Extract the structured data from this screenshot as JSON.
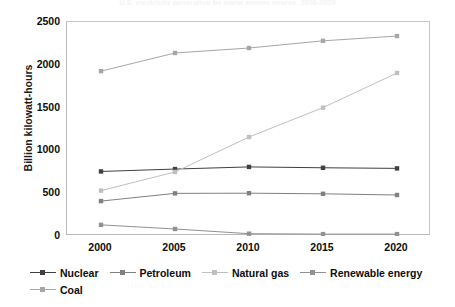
{
  "chart_data": {
    "type": "line",
    "title": "U.S. electricity generation by major energy source, 2000-2020",
    "xlabel": "",
    "ylabel": "Billion kilowatt-hours",
    "categories": [
      "2000",
      "2005",
      "2010",
      "2015",
      "2020"
    ],
    "x": [
      2000,
      2005,
      2010,
      2015,
      2020
    ],
    "xticks": [
      "2000",
      "2005",
      "2010",
      "2015",
      "2020"
    ],
    "yticks": [
      "0",
      "500",
      "1000",
      "1500",
      "2000",
      "2500"
    ],
    "ytick_values": [
      0,
      500,
      1000,
      1500,
      2000,
      2500
    ],
    "ylim": [
      0,
      2500
    ],
    "xlim": [
      2000,
      2020
    ],
    "grid": false,
    "legend_position": "bottom",
    "series": [
      {
        "name": "Nuclear",
        "color": "#404040",
        "marker": "square",
        "values": [
          754,
          782,
          807,
          797,
          790
        ]
      },
      {
        "name": "Petroleum",
        "color": "#808080",
        "marker": "square",
        "values": [
          408,
          498,
          500,
          493,
          479
        ]
      },
      {
        "name": "Natural gas",
        "color": "#bfbfbf",
        "marker": "square",
        "values": [
          530,
          748,
          1156,
          1500,
          1904
        ]
      },
      {
        "name": "Renewable energy",
        "color": "#919191",
        "marker": "square",
        "values": [
          130,
          82,
          27,
          22,
          22
        ]
      },
      {
        "name": "Coal",
        "color": "#a6a6a6",
        "marker": "square",
        "values": [
          1926,
          2138,
          2196,
          2280,
          2336
        ]
      }
    ]
  }
}
